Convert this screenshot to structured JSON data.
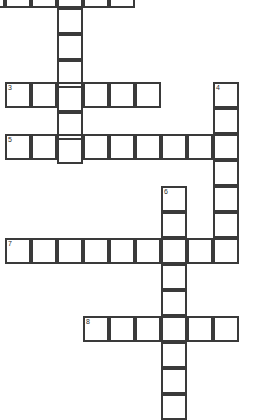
{
  "puzzle": {
    "title": "Crossword Grid",
    "type": "crossword-grid",
    "grid": {
      "cell_size": 26,
      "origin_x": 5,
      "origin_y": -18,
      "canvas_width": 265,
      "canvas_height": 418,
      "columns": 9,
      "rows": 17,
      "border_color": "#3a3a3a",
      "cell_fill": "#ffffff",
      "background": "#ffffff",
      "number_color": "#2b2b2b"
    },
    "entries": [
      {
        "number": "1",
        "direction": "across",
        "length": 6,
        "start_col": -1,
        "start_row": 0,
        "x": -21,
        "y": -18,
        "clipped_left": true,
        "letters": [
          "",
          "",
          "",
          "",
          "",
          ""
        ]
      },
      {
        "number": "2",
        "direction": "down",
        "length": 7,
        "start_col": 2,
        "start_row": 0,
        "x": 57,
        "y": -18,
        "clipped_top": true,
        "letters": [
          "",
          "",
          "",
          "",
          "",
          "",
          ""
        ]
      },
      {
        "number": "3",
        "direction": "across",
        "length": 6,
        "start_col": 0,
        "start_row": 4,
        "x": 5,
        "y": 82,
        "letters": [
          "",
          "",
          "",
          "",
          "",
          ""
        ]
      },
      {
        "number": "4",
        "direction": "down",
        "length": 7,
        "start_col": 8,
        "start_row": 4,
        "x": 213,
        "y": 82,
        "letters": [
          "",
          "",
          "",
          "",
          "",
          "",
          ""
        ]
      },
      {
        "number": "5",
        "direction": "across",
        "length": 9,
        "start_col": 0,
        "start_row": 6,
        "x": 5,
        "y": 134,
        "letters": [
          "",
          "",
          "",
          "",
          "",
          "",
          "",
          "",
          ""
        ]
      },
      {
        "number": "6",
        "direction": "down",
        "length": 9,
        "start_col": 6,
        "start_row": 8,
        "x": 161,
        "y": 186,
        "clipped_bottom": true,
        "letters": [
          "",
          "",
          "",
          "",
          "",
          "",
          "",
          "",
          ""
        ]
      },
      {
        "number": "7",
        "direction": "across",
        "length": 9,
        "start_col": 0,
        "start_row": 10,
        "x": 5,
        "y": 238,
        "letters": [
          "",
          "",
          "",
          "",
          "",
          "",
          "",
          "",
          ""
        ]
      },
      {
        "number": "8",
        "direction": "across",
        "length": 6,
        "start_col": 3,
        "start_row": 13,
        "x": 83,
        "y": 316,
        "letters": [
          "",
          "",
          "",
          "",
          "",
          ""
        ]
      }
    ],
    "numbered_cells": [
      {
        "number": "1",
        "x": -21,
        "y": -18
      },
      {
        "number": "3",
        "x": 5,
        "y": 82
      },
      {
        "number": "4",
        "x": 213,
        "y": 82
      },
      {
        "number": "5",
        "x": 5,
        "y": 134
      },
      {
        "number": "6",
        "x": 161,
        "y": 186
      },
      {
        "number": "7",
        "x": 5,
        "y": 238
      },
      {
        "number": "8",
        "x": 83,
        "y": 316
      }
    ]
  }
}
